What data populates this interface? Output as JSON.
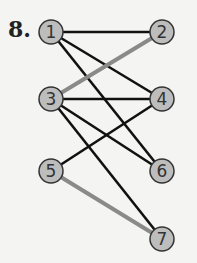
{
  "problem_number": "8.",
  "colors": {
    "node_fill": "#bdbdbd",
    "node_stroke": "#333333",
    "edge_black": "#111111",
    "edge_gray": "#8a8a8a"
  },
  "nodes": [
    {
      "id": "1",
      "x": 51,
      "y": 32
    },
    {
      "id": "2",
      "x": 162,
      "y": 32
    },
    {
      "id": "3",
      "x": 51,
      "y": 99
    },
    {
      "id": "4",
      "x": 162,
      "y": 99
    },
    {
      "id": "5",
      "x": 51,
      "y": 171
    },
    {
      "id": "6",
      "x": 162,
      "y": 171
    },
    {
      "id": "7",
      "x": 162,
      "y": 239
    }
  ],
  "edges": [
    {
      "from": "1",
      "to": "2",
      "color": "black"
    },
    {
      "from": "1",
      "to": "4",
      "color": "black"
    },
    {
      "from": "1",
      "to": "6",
      "color": "black"
    },
    {
      "from": "3",
      "to": "2",
      "color": "gray"
    },
    {
      "from": "3",
      "to": "4",
      "color": "black"
    },
    {
      "from": "3",
      "to": "6",
      "color": "black"
    },
    {
      "from": "3",
      "to": "7",
      "color": "black"
    },
    {
      "from": "5",
      "to": "4",
      "color": "black"
    },
    {
      "from": "5",
      "to": "7",
      "color": "gray"
    }
  ]
}
